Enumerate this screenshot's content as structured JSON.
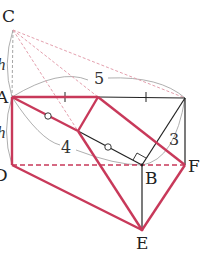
{
  "diagram": {
    "type": "geometry-figure",
    "colors": {
      "red": "#c8395a",
      "pink_dashed": "#e4a0ae",
      "black": "#222222",
      "gray": "#888888",
      "arc": "#999999"
    },
    "points": {
      "C": {
        "label": "C",
        "x": 13,
        "y": 30
      },
      "A": {
        "label": "A",
        "x": 12,
        "y": 97
      },
      "D": {
        "label": "D",
        "x": 12,
        "y": 165
      },
      "B": {
        "label": "B",
        "x": 142,
        "y": 165
      },
      "F": {
        "label": "F",
        "x": 185,
        "y": 165
      },
      "E": {
        "label": "E",
        "x": 142,
        "y": 230
      },
      "TR": {
        "label": "",
        "x": 185,
        "y": 98
      },
      "M": {
        "label": "",
        "x": 98,
        "y": 97
      },
      "H": {
        "label": "",
        "x": 78,
        "y": 131
      }
    },
    "labels": {
      "C": "C",
      "A": "A",
      "D": "D",
      "B": "B",
      "F": "F",
      "E": "E",
      "h_upper": "h",
      "h_lower": "h",
      "len_5": "5",
      "len_4": "4",
      "len_3": "3"
    }
  }
}
